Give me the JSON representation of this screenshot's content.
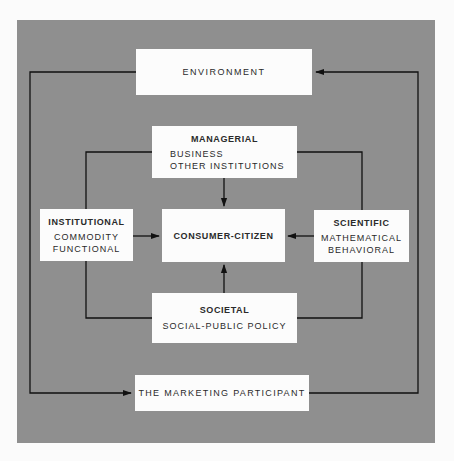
{
  "diagram": {
    "colors": {
      "background": "#8f8f8f",
      "box": "#fcfcfc",
      "lines": "#111111",
      "page": "#fbfbfb"
    },
    "nodes": {
      "environment": {
        "title": "ENVIRONMENT"
      },
      "managerial": {
        "title": "MANAGERIAL",
        "lines": [
          "BUSINESS",
          "OTHER INSTITUTIONS"
        ]
      },
      "institutional": {
        "title": "INSTITUTIONAL",
        "lines": [
          "COMMODITY",
          "FUNCTIONAL"
        ]
      },
      "consumer_citizen": {
        "title": "CONSUMER-CITIZEN"
      },
      "scientific": {
        "title": "SCIENTIFIC",
        "lines": [
          "MATHEMATICAL",
          "BEHAVIORAL"
        ]
      },
      "societal": {
        "title": "SOCIETAL",
        "lines": [
          "SOCIAL-PUBLIC POLICY"
        ]
      },
      "marketing_participant": {
        "title": "THE MARKETING PARTICIPANT"
      }
    },
    "edges": [
      {
        "from": "managerial",
        "to": "consumer_citizen"
      },
      {
        "from": "institutional",
        "to": "consumer_citizen"
      },
      {
        "from": "scientific",
        "to": "consumer_citizen"
      },
      {
        "from": "societal",
        "to": "consumer_citizen"
      },
      {
        "from": "environment",
        "to": "marketing_participant",
        "route": "left loop"
      },
      {
        "from": "marketing_participant",
        "to": "environment",
        "route": "right loop"
      },
      {
        "from": "managerial",
        "to": "institutional",
        "route": "inner left frame"
      },
      {
        "from": "managerial",
        "to": "scientific",
        "route": "inner right frame"
      },
      {
        "from": "institutional",
        "to": "societal",
        "route": "inner left frame"
      },
      {
        "from": "scientific",
        "to": "societal",
        "route": "inner right frame"
      }
    ]
  }
}
